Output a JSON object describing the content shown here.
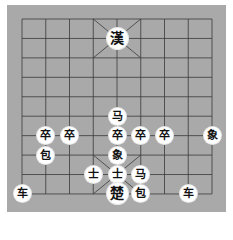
{
  "board": {
    "background": "#a9a9a9",
    "line_color": "#3a3a3a",
    "columns": 9,
    "rows": 10,
    "origin": {
      "x": 22,
      "y": 19
    },
    "spacing": {
      "x": 23.75,
      "y": 19.44
    }
  },
  "pieces": [
    {
      "name": "general-black",
      "glyph": "漢",
      "col": 4,
      "row": 1,
      "big": true
    },
    {
      "name": "horse",
      "glyph": "马",
      "col": 4,
      "row": 5
    },
    {
      "name": "soldier",
      "glyph": "卒",
      "col": 1,
      "row": 6
    },
    {
      "name": "soldier",
      "glyph": "卒",
      "col": 2,
      "row": 6
    },
    {
      "name": "soldier",
      "glyph": "卒",
      "col": 4,
      "row": 6
    },
    {
      "name": "soldier",
      "glyph": "卒",
      "col": 5,
      "row": 6
    },
    {
      "name": "soldier",
      "glyph": "卒",
      "col": 6,
      "row": 6
    },
    {
      "name": "elephant",
      "glyph": "象",
      "col": 8,
      "row": 6
    },
    {
      "name": "cannon",
      "glyph": "包",
      "col": 1,
      "row": 7
    },
    {
      "name": "elephant",
      "glyph": "象",
      "col": 4,
      "row": 7
    },
    {
      "name": "advisor",
      "glyph": "士",
      "col": 3,
      "row": 8
    },
    {
      "name": "advisor",
      "glyph": "士",
      "col": 4,
      "row": 8
    },
    {
      "name": "horse",
      "glyph": "马",
      "col": 5,
      "row": 8
    },
    {
      "name": "chariot",
      "glyph": "车",
      "col": 0,
      "row": 9
    },
    {
      "name": "general-red",
      "glyph": "楚",
      "col": 4,
      "row": 9,
      "big": true
    },
    {
      "name": "cannon",
      "glyph": "包",
      "col": 5,
      "row": 9
    },
    {
      "name": "chariot",
      "glyph": "车",
      "col": 7,
      "row": 9
    }
  ]
}
